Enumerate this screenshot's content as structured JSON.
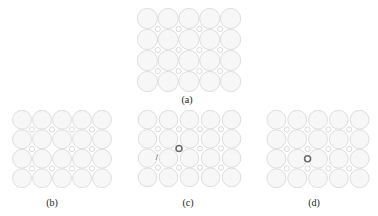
{
  "figure": {
    "panels": [
      {
        "id": "a",
        "label": "(a)",
        "x": 137,
        "y": 8,
        "w": 104,
        "h": 84,
        "defect": "none",
        "label_x": 167,
        "label_y": 94
      },
      {
        "id": "b",
        "label": "(b)",
        "x": 12,
        "y": 110,
        "w": 100,
        "h": 78,
        "defect": "vacancy",
        "defect_col": 2,
        "defect_row": 2,
        "label_x": 32,
        "label_y": 197
      },
      {
        "id": "c",
        "label": "(c)",
        "x": 137,
        "y": 110,
        "w": 105,
        "h": 77,
        "defect": "interstitial",
        "defect_col": 2,
        "defect_row": 2,
        "label_x": 168,
        "label_y": 197
      },
      {
        "id": "d",
        "label": "(d)",
        "x": 266,
        "y": 110,
        "w": 104,
        "h": 78,
        "defect": "substitutional",
        "defect_col": 2,
        "defect_row": 3,
        "label_x": 294,
        "label_y": 197
      }
    ],
    "grid": {
      "cols": 5,
      "rows": 4
    },
    "colors": {
      "sphere_fill": "#f7f7f7",
      "sphere_stroke": "#d6d6d6",
      "defect": "#6a6a6a",
      "label": "#222222"
    }
  }
}
